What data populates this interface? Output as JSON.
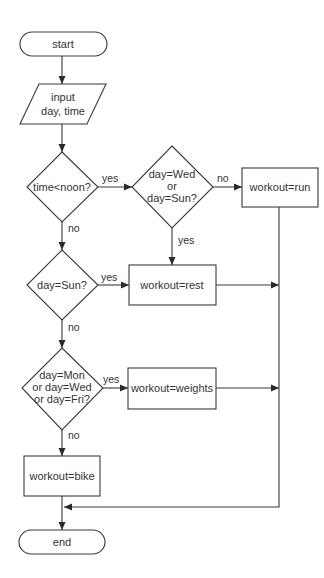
{
  "diagram": {
    "type": "flowchart",
    "nodes": {
      "start": {
        "label": "start"
      },
      "input": {
        "line1": "input",
        "line2": "day, time"
      },
      "time_check": {
        "label": "time<noon?"
      },
      "wed_sun_check": {
        "line1": "day=Wed",
        "line2": "or",
        "line3": "day=Sun?"
      },
      "run": {
        "label": "workout=run"
      },
      "sun_check": {
        "label": "day=Sun?"
      },
      "rest": {
        "label": "workout=rest"
      },
      "mwf_check": {
        "line1": "day=Mon",
        "line2": "or day=Wed",
        "line3": "or day=Fri?"
      },
      "weights": {
        "label": "workout=weights"
      },
      "bike": {
        "label": "workout=bike"
      },
      "end": {
        "label": "end"
      }
    },
    "edge_labels": {
      "time_yes": "yes",
      "time_no": "no",
      "wedsun_no": "no",
      "wedsun_yes": "yes",
      "sun_yes": "yes",
      "sun_no": "no",
      "mwf_yes": "yes",
      "mwf_no": "no"
    },
    "edges": [
      {
        "from": "start",
        "to": "input"
      },
      {
        "from": "input",
        "to": "time_check"
      },
      {
        "from": "time_check",
        "to": "wed_sun_check",
        "label": "yes"
      },
      {
        "from": "time_check",
        "to": "sun_check",
        "label": "no"
      },
      {
        "from": "wed_sun_check",
        "to": "run",
        "label": "no"
      },
      {
        "from": "wed_sun_check",
        "to": "rest",
        "label": "yes"
      },
      {
        "from": "sun_check",
        "to": "rest",
        "label": "yes"
      },
      {
        "from": "sun_check",
        "to": "mwf_check",
        "label": "no"
      },
      {
        "from": "mwf_check",
        "to": "weights",
        "label": "yes"
      },
      {
        "from": "mwf_check",
        "to": "bike",
        "label": "no"
      },
      {
        "from": "run",
        "to": "end"
      },
      {
        "from": "rest",
        "to": "end"
      },
      {
        "from": "weights",
        "to": "end"
      },
      {
        "from": "bike",
        "to": "end"
      }
    ]
  }
}
